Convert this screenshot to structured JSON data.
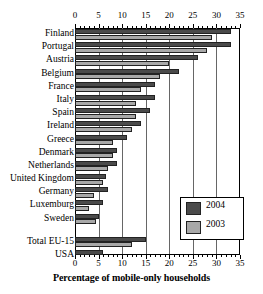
{
  "chart_data": {
    "type": "bar",
    "orientation": "horizontal",
    "title": "",
    "xlabel": "Percentage of mobile-only households",
    "ylabel": "",
    "xlim": [
      0,
      35
    ],
    "xticks": [
      0,
      5,
      10,
      15,
      20,
      25,
      30,
      35
    ],
    "xtick_labels": [
      "0",
      "5",
      "10",
      "15",
      "20",
      "25",
      "30",
      "35"
    ],
    "minor_tick_step": 1,
    "grid": "vertical gridlines at major ticks",
    "axis_duplicated_top_and_bottom": true,
    "legend": {
      "position": "lower-right inside plot",
      "entries": [
        {
          "name": "2004",
          "color": "#4a4a4a"
        },
        {
          "name": "2003",
          "color": "#a8a8a8"
        }
      ]
    },
    "categories": [
      "Finland",
      "Portugal",
      "Austria",
      "Belgium",
      "France",
      "Italy",
      "Spain",
      "Ireland",
      "Greece",
      "Denmark",
      "Netherlands",
      "United Kingdom",
      "Germany",
      "Luxemburg",
      "Sweden",
      "Total EU-15",
      "USA"
    ],
    "separator_after_index": 14,
    "series": [
      {
        "name": "2004",
        "color": "#4a4a4a",
        "values": [
          33,
          33,
          26,
          22,
          17,
          17,
          16,
          14,
          11,
          9,
          9,
          6.5,
          7,
          6,
          5,
          15,
          6
        ]
      },
      {
        "name": "2003",
        "color": "#a8a8a8",
        "values": [
          29,
          28,
          20,
          18,
          14,
          13,
          13,
          12,
          8,
          8,
          7,
          6,
          4,
          3,
          4.5,
          12,
          null
        ]
      }
    ]
  }
}
